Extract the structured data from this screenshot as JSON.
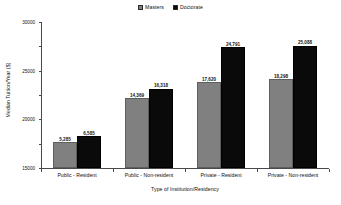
{
  "chart_data": {
    "type": "bar",
    "title": "",
    "xlabel": "Type of Institution/Residency",
    "ylabel": "Median Tuition/Year ($)",
    "categories": [
      "Public - Resident",
      "Public - Non-resident",
      "Private - Resident",
      "Private - Non-resident"
    ],
    "series": [
      {
        "name": "Masters",
        "color": "#808080",
        "values": [
          5285,
          14369,
          17620,
          18298
        ],
        "labels": [
          "5,285",
          "14,369",
          "17,620",
          "18,298"
        ]
      },
      {
        "name": "Doctorate",
        "color": "#0a0a0a",
        "values": [
          6585,
          16318,
          24791,
          25088
        ],
        "labels": [
          "6,585",
          "16,318",
          "24,791",
          "25,088"
        ]
      }
    ],
    "ylim": [
      0,
      30000
    ],
    "yticks": [
      0,
      5000,
      10000,
      15000,
      20000,
      25000,
      30000
    ],
    "ytick_labels": [
      "0",
      "5000",
      "10000",
      "15000",
      "20000",
      "25000",
      "30000"
    ],
    "grid": false,
    "legend_position": "top-center",
    "data_labels": true
  },
  "legend": {
    "entries": [
      {
        "label": "Masters",
        "color": "#808080"
      },
      {
        "label": "Doctorate",
        "color": "#0a0a0a"
      }
    ]
  }
}
